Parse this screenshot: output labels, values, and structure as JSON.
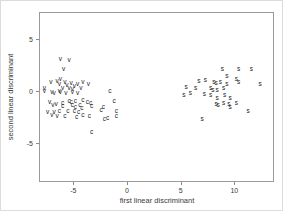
{
  "figure": {
    "background": "#ffffff",
    "box_color": "#9a9a9a",
    "text_color": "#3a3a3a",
    "point_color": "#222222"
  },
  "chart_data": {
    "type": "scatter",
    "title": "",
    "xlabel": "first linear discriminant",
    "ylabel": "second linear discriminant",
    "x_ticks": [
      -5,
      0,
      5,
      10
    ],
    "y_ticks": [
      5,
      0,
      -5
    ],
    "xlim": [
      -8.2,
      13.7
    ],
    "ylim": [
      -8.7,
      7.6
    ],
    "grid": false,
    "legend": "none",
    "marker_style": "text-letters",
    "series": [
      {
        "name": "group-v",
        "label": "v",
        "points": [
          [
            -6.2,
            3.1
          ],
          [
            -5.4,
            3.0
          ],
          [
            -5.9,
            2.1
          ],
          [
            -7.7,
            0.3
          ],
          [
            -7.1,
            0.9
          ],
          [
            -6.5,
            1.0
          ],
          [
            -6.2,
            1.2
          ],
          [
            -6.3,
            0.7
          ],
          [
            -5.8,
            0.9
          ],
          [
            -5.6,
            0.6
          ],
          [
            -5.2,
            0.8
          ],
          [
            -4.9,
            0.5
          ],
          [
            -4.6,
            0.7
          ],
          [
            -5.4,
            0.3
          ],
          [
            -6.0,
            0.3
          ],
          [
            -4.1,
            0.9
          ],
          [
            -3.6,
            0.7
          ],
          [
            -7.0,
            -0.1
          ],
          [
            -6.3,
            0.0
          ],
          [
            -5.1,
            0.2
          ],
          [
            -4.3,
            0.3
          ],
          [
            -7.7,
            0.0
          ],
          [
            -6.8,
            -0.2
          ],
          [
            -6.2,
            -0.1
          ],
          [
            -5.7,
            -0.2
          ],
          [
            -5.1,
            -0.1
          ],
          [
            -4.6,
            -0.2
          ],
          [
            -7.2,
            -1.0
          ],
          [
            -6.6,
            -1.2
          ],
          [
            -6.9,
            -1.3
          ],
          [
            -7.4,
            -2.0
          ],
          [
            -6.8,
            -2.0
          ],
          [
            -7.0,
            -2.3
          ],
          [
            -6.5,
            -2.4
          ]
        ]
      },
      {
        "name": "group-c",
        "label": "c",
        "points": [
          [
            -5.4,
            -0.9
          ],
          [
            -5.2,
            -1.0
          ],
          [
            -4.8,
            -0.9
          ],
          [
            -4.1,
            -0.8
          ],
          [
            -3.7,
            -1.0
          ],
          [
            -3.4,
            -1.1
          ],
          [
            -6.0,
            -1.1
          ],
          [
            -6.0,
            -1.4
          ],
          [
            -5.1,
            -1.3
          ],
          [
            -4.8,
            -1.5
          ],
          [
            -4.4,
            -1.3
          ],
          [
            -4.2,
            -1.6
          ],
          [
            -3.3,
            -1.4
          ],
          [
            -2.2,
            -1.5
          ],
          [
            -6.3,
            -1.9
          ],
          [
            -5.5,
            -1.9
          ],
          [
            -4.9,
            -1.9
          ],
          [
            -4.5,
            -2.0
          ],
          [
            -5.8,
            -2.4
          ],
          [
            -4.7,
            -2.5
          ],
          [
            -4.1,
            -2.3
          ],
          [
            -3.5,
            -2.4
          ],
          [
            -2.1,
            -2.7
          ],
          [
            -1.0,
            -2.4
          ],
          [
            -3.3,
            -3.9
          ],
          [
            -1.6,
            0.0
          ],
          [
            -1.2,
            -0.9
          ],
          [
            -2.4,
            -1.8
          ],
          [
            -1.0,
            -1.9
          ],
          [
            -1.8,
            -2.6
          ]
        ]
      },
      {
        "name": "group-s",
        "label": "s",
        "points": [
          [
            8.9,
            2.1
          ],
          [
            10.4,
            2.1
          ],
          [
            11.6,
            2.1
          ],
          [
            9.3,
            1.5
          ],
          [
            10.2,
            1.2
          ],
          [
            6.7,
            1.0
          ],
          [
            7.3,
            1.1
          ],
          [
            8.1,
            0.9
          ],
          [
            8.3,
            0.8
          ],
          [
            8.7,
            0.9
          ],
          [
            9.3,
            0.7
          ],
          [
            10.4,
            0.9
          ],
          [
            12.4,
            0.7
          ],
          [
            5.5,
            0.4
          ],
          [
            6.4,
            0.3
          ],
          [
            7.8,
            0.3
          ],
          [
            8.0,
            0.1
          ],
          [
            8.4,
            0.1
          ],
          [
            9.0,
            0.3
          ],
          [
            5.3,
            -0.4
          ],
          [
            5.9,
            -0.2
          ],
          [
            7.2,
            -0.3
          ],
          [
            7.8,
            -0.4
          ],
          [
            8.4,
            -0.6
          ],
          [
            9.1,
            -0.4
          ],
          [
            9.6,
            -0.6
          ],
          [
            8.3,
            -1.2
          ],
          [
            8.5,
            -1.3
          ],
          [
            9.0,
            -1.1
          ],
          [
            9.5,
            -1.2
          ],
          [
            9.6,
            -1.5
          ],
          [
            10.2,
            -1.1
          ],
          [
            11.3,
            -1.9
          ],
          [
            7.0,
            -2.7
          ]
        ]
      }
    ]
  }
}
